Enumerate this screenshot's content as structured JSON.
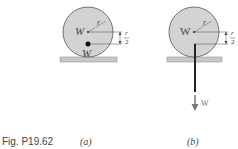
{
  "figure": {
    "label": "Fig. P19.62",
    "panels": [
      {
        "caption": "(a)",
        "center_weight_label": "W",
        "point_weight_label": "W",
        "radius_label": "r",
        "offset_label": "r/2"
      },
      {
        "caption": "(b)",
        "center_weight_label": "W",
        "force_label": "W",
        "radius_label": "r",
        "offset_label": "r/2"
      }
    ]
  },
  "colors": {
    "disk_fill": "#d3d3d3",
    "ground_fill": "#c8c8c8",
    "line": "#444444"
  }
}
